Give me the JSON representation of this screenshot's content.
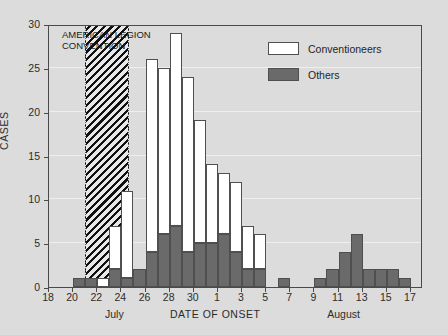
{
  "chart_data": {
    "type": "bar",
    "title": "",
    "xlabel": "DATE OF ONSET",
    "ylabel": "CASES",
    "ylim": [
      0,
      30
    ],
    "ytick_values": [
      0,
      5,
      10,
      15,
      20,
      25,
      30
    ],
    "ytick_labels": [
      "0",
      "5",
      "10",
      "15",
      "20",
      "25",
      "30"
    ],
    "grid": true,
    "stacked": true,
    "legend_position": "top-right",
    "x": [
      "July 18",
      "July 19",
      "July 20",
      "July 21",
      "July 22",
      "July 23",
      "July 24",
      "July 25",
      "July 26",
      "July 27",
      "July 28",
      "July 29",
      "July 30",
      "July 31",
      "Aug 1",
      "Aug 2",
      "Aug 3",
      "Aug 4",
      "Aug 5",
      "Aug 6",
      "Aug 7",
      "Aug 8",
      "Aug 9",
      "Aug 10",
      "Aug 11",
      "Aug 12",
      "Aug 13",
      "Aug 14",
      "Aug 15",
      "Aug 16",
      "Aug 17"
    ],
    "xtick_labels": [
      "18",
      "20",
      "22",
      "24",
      "26",
      "28",
      "30",
      "1",
      "3",
      "5",
      "7",
      "9",
      "11",
      "13",
      "15",
      "17"
    ],
    "xtick_positions": [
      0,
      2,
      4,
      6,
      8,
      10,
      12,
      14,
      16,
      18,
      20,
      22,
      24,
      26,
      28,
      30
    ],
    "month_labels": [
      {
        "text": "July",
        "index": 5
      },
      {
        "text": "August",
        "index": 24
      }
    ],
    "series": [
      {
        "name": "Conventioneers",
        "color": "#ffffff",
        "values": [
          0,
          0,
          0,
          0,
          1,
          5,
          10,
          0,
          22,
          19,
          22,
          20,
          14,
          9,
          7,
          8,
          5,
          4,
          0,
          0,
          0,
          0,
          0,
          0,
          0,
          0,
          0,
          0,
          0,
          0,
          0
        ]
      },
      {
        "name": "Others",
        "color": "#6a6a6a",
        "values": [
          0,
          0,
          1,
          1,
          0,
          2,
          1,
          2,
          4,
          6,
          7,
          4,
          5,
          5,
          6,
          4,
          2,
          2,
          0,
          1,
          0,
          0,
          1,
          2,
          4,
          6,
          2,
          2,
          2,
          1,
          0
        ]
      }
    ],
    "totals": [
      0,
      0,
      1,
      1,
      1,
      7,
      11,
      2,
      26,
      25,
      29,
      24,
      19,
      14,
      13,
      12,
      7,
      6,
      0,
      1,
      0,
      0,
      1,
      2,
      4,
      6,
      2,
      2,
      2,
      1,
      0
    ],
    "annotation": {
      "text_line1": "AMERICAN LEGION",
      "text_line2": "CONVENTION",
      "band_start_index": 3,
      "band_end_index": 6.6,
      "fill": "hatched"
    }
  },
  "legend": {
    "items": [
      {
        "label": "Conventioneers",
        "swatch": "white"
      },
      {
        "label": "Others",
        "swatch": "dark"
      }
    ]
  }
}
